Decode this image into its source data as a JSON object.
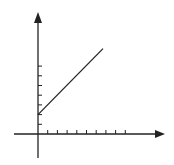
{
  "chart_data": {
    "type": "line",
    "title": "",
    "xlabel": "",
    "ylabel": "",
    "x_ticks": [
      1,
      2,
      3,
      4,
      5,
      6,
      7,
      8,
      9
    ],
    "y_ticks": [
      1,
      2,
      3,
      4,
      5,
      6,
      7
    ],
    "tick_labels_visible": false,
    "grid": false,
    "legend": null,
    "axes_arrows": true,
    "xlim": [
      -2.5,
      13
    ],
    "ylim": [
      -2.5,
      13
    ],
    "series": [
      {
        "name": "line",
        "x": [
          0,
          6.7
        ],
        "y": [
          2,
          8.8
        ],
        "color": "#222222"
      }
    ]
  },
  "colors": {
    "axis": "#222222",
    "line": "#222222",
    "background": "#ffffff"
  }
}
